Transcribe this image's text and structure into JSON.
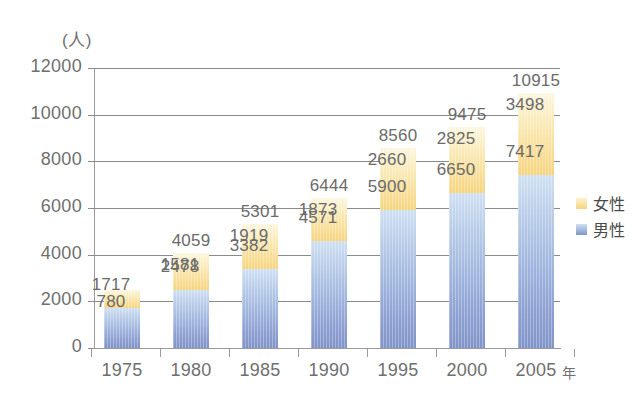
{
  "chart_data": {
    "type": "bar",
    "subtype": "stacked-bar",
    "title": "",
    "xlabel": "年",
    "ylabel": "(人)",
    "y_unit_label": "(人)",
    "x_unit_label": "年",
    "categories": [
      "1975",
      "1980",
      "1985",
      "1990",
      "1995",
      "2000",
      "2005"
    ],
    "series": [
      {
        "name": "男性",
        "color": "#8094c9",
        "values": [
          1717,
          2478,
          3382,
          4571,
          5900,
          6650,
          7417
        ]
      },
      {
        "name": "女性",
        "color": "#f6d47f",
        "values": [
          780,
          1581,
          1919,
          1873,
          2660,
          2825,
          3498
        ]
      }
    ],
    "totals": [
      2497,
      4059,
      5301,
      6444,
      8560,
      9475,
      10915
    ],
    "total_labels": [
      "",
      "4059",
      "5301",
      "6444",
      "8560",
      "9475",
      "10915"
    ],
    "ylim": [
      0,
      12000
    ],
    "ytick_values": [
      0,
      2000,
      4000,
      6000,
      8000,
      10000,
      12000
    ],
    "ytick_labels": [
      "0",
      "2000",
      "4000",
      "6000",
      "8000",
      "10000",
      "12000"
    ],
    "grid": true,
    "grid_axis": "y",
    "legend_position": "right",
    "stack_order": [
      "男性",
      "女性"
    ]
  },
  "axis": {
    "y_unit": "(人)",
    "x_unit": "年",
    "y_ticks": [
      {
        "label": "12000",
        "value": 12000
      },
      {
        "label": "10000",
        "value": 10000
      },
      {
        "label": "8000",
        "value": 8000
      },
      {
        "label": "6000",
        "value": 6000
      },
      {
        "label": "4000",
        "value": 4000
      },
      {
        "label": "2000",
        "value": 2000
      },
      {
        "label": "0",
        "value": 0
      }
    ],
    "x_ticks": [
      "1975",
      "1980",
      "1985",
      "1990",
      "1995",
      "2000",
      "2005"
    ]
  },
  "bars": [
    {
      "year": "1975",
      "male": "1717",
      "female": "780",
      "total": ""
    },
    {
      "year": "1980",
      "male": "2478",
      "female": "1581",
      "total": "4059"
    },
    {
      "year": "1985",
      "male": "3382",
      "female": "1919",
      "total": "5301"
    },
    {
      "year": "1990",
      "male": "4571",
      "female": "1873",
      "total": "6444"
    },
    {
      "year": "1995",
      "male": "5900",
      "female": "2660",
      "total": "8560"
    },
    {
      "year": "2000",
      "male": "6650",
      "female": "2825",
      "total": "9475"
    },
    {
      "year": "2005",
      "male": "7417",
      "female": "3498",
      "total": "10915"
    }
  ],
  "legend": {
    "items": [
      {
        "label": "女性",
        "color": "#f6d47f",
        "swatch": "female-swatch"
      },
      {
        "label": "男性",
        "color": "#8094c9",
        "swatch": "male-swatch"
      }
    ]
  },
  "colors": {
    "male": "#8094c9",
    "male_light": "#cfe0f2",
    "female": "#f6d47f",
    "female_light": "#fdf6e0",
    "grid": "#8a8a8a",
    "text": "#6b6b6b",
    "background": "#ffffff"
  }
}
